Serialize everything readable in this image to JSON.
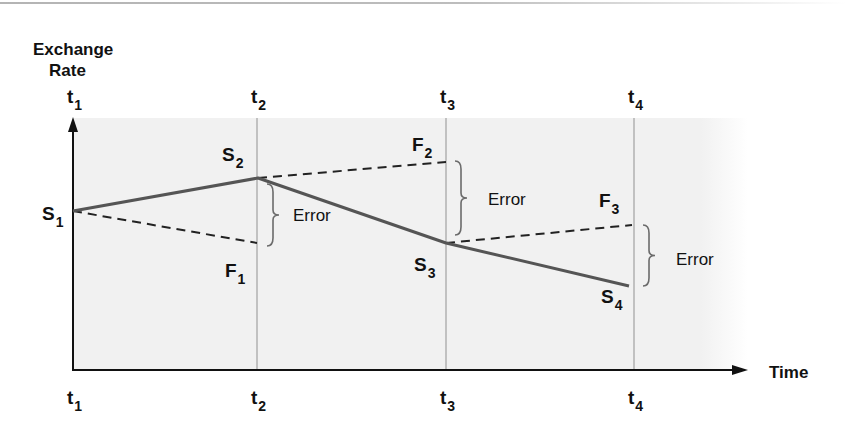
{
  "axes": {
    "y_label_line1": "Exchange",
    "y_label_line2": "Rate",
    "x_label": "Time"
  },
  "colors": {
    "background": "#ffffff",
    "plot_shade": "#f1f1f1",
    "axis": "#111111",
    "spot_line": "#555555",
    "forward_line": "#222222",
    "gridline": "#a8a8a8",
    "brace": "#6b6b6b",
    "text": "#111111"
  },
  "time_points": [
    {
      "base": "t",
      "sub": "1",
      "x": 73
    },
    {
      "base": "t",
      "sub": "2",
      "x": 257
    },
    {
      "base": "t",
      "sub": "3",
      "x": 446
    },
    {
      "base": "t",
      "sub": "4",
      "x": 634
    }
  ],
  "spot_rates": [
    {
      "base": "S",
      "sub": "1",
      "x": 73,
      "y": 211,
      "label_x": 42,
      "label_y": 220
    },
    {
      "base": "S",
      "sub": "2",
      "x": 258,
      "y": 178,
      "label_x": 222,
      "label_y": 161
    },
    {
      "base": "S",
      "sub": "3",
      "x": 446,
      "y": 243,
      "label_x": 414,
      "label_y": 271
    },
    {
      "base": "S",
      "sub": "4",
      "x": 629,
      "y": 286,
      "label_x": 601,
      "label_y": 303
    }
  ],
  "forward_rates": [
    {
      "base": "F",
      "sub": "1",
      "from_x": 73,
      "from_y": 211,
      "x": 257,
      "y": 243,
      "label_x": 225,
      "label_y": 277
    },
    {
      "base": "F",
      "sub": "2",
      "from_x": 258,
      "from_y": 178,
      "x": 446,
      "y": 162,
      "label_x": 412,
      "label_y": 151
    },
    {
      "base": "F",
      "sub": "3",
      "from_x": 446,
      "from_y": 243,
      "x": 632,
      "y": 225,
      "label_x": 599,
      "label_y": 207
    }
  ],
  "errors": [
    {
      "label": "Error",
      "brace_x": 267,
      "top_y": 184,
      "bottom_y": 246,
      "label_x": 293,
      "label_y": 221
    },
    {
      "label": "Error",
      "brace_x": 455,
      "top_y": 161,
      "bottom_y": 235,
      "label_x": 488,
      "label_y": 205
    },
    {
      "label": "Error",
      "brace_x": 643,
      "top_y": 225,
      "bottom_y": 286,
      "label_x": 676,
      "label_y": 265
    }
  ],
  "chart_data": {
    "type": "line",
    "title": "",
    "xlabel": "Time",
    "ylabel": "Exchange Rate",
    "categories": [
      "t1",
      "t2",
      "t3",
      "t4"
    ],
    "series": [
      {
        "name": "Spot rate (S)",
        "style": "solid",
        "points": [
          {
            "x": "t1",
            "label": "S1",
            "relative_level": 0.58
          },
          {
            "x": "t2",
            "label": "S2",
            "relative_level": 0.76
          },
          {
            "x": "t3",
            "label": "S3",
            "relative_level": 0.41
          },
          {
            "x": "t4",
            "label": "S4",
            "relative_level": 0.17
          }
        ]
      },
      {
        "name": "Forward rate (F)",
        "style": "dashed",
        "segments": [
          {
            "from": "S1 at t1",
            "to": "F1 at t2",
            "end_level": 0.41
          },
          {
            "from": "S2 at t2",
            "to": "F2 at t3",
            "end_level": 0.84
          },
          {
            "from": "S3 at t3",
            "to": "F3 at t4",
            "end_level": 0.51
          }
        ]
      }
    ],
    "annotations": [
      {
        "text": "Error",
        "between": [
          "S2",
          "F1"
        ],
        "at": "t2"
      },
      {
        "text": "Error",
        "between": [
          "F2",
          "S3"
        ],
        "at": "t3"
      },
      {
        "text": "Error",
        "between": [
          "F3",
          "S4"
        ],
        "at": "t4"
      }
    ],
    "grid": "vertical lines at t2, t3, t4",
    "legend": "none"
  }
}
